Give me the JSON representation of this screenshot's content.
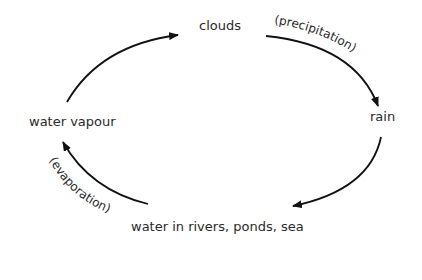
{
  "diagram": {
    "nodes": {
      "clouds": "clouds",
      "rain": "rain",
      "water_bodies": "water in rivers, ponds, sea",
      "water_vapour": "water vapour"
    },
    "edges": [
      {
        "from": "water vapour",
        "to": "clouds",
        "label": ""
      },
      {
        "from": "clouds",
        "to": "rain",
        "label": "(precipitation)"
      },
      {
        "from": "rain",
        "to": "water in rivers, ponds, sea",
        "label": ""
      },
      {
        "from": "water in rivers, ponds, sea",
        "to": "water vapour",
        "label": "(evaporation)"
      }
    ],
    "labels": {
      "precipitation": "(precipitation)",
      "evaporation": "(evaporation)"
    },
    "colors": {
      "text": "#2a2a2a",
      "arrow": "#111111",
      "background": "#ffffff"
    }
  }
}
